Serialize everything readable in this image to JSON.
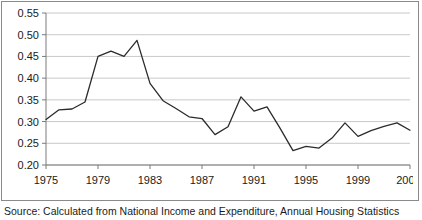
{
  "figure": {
    "caption": "Source: Calculated from National Income and Expenditure, Annual Housing Statistics",
    "border_color": "#8a8a8a",
    "background": "#ffffff"
  },
  "chart_data": {
    "type": "line",
    "title": "",
    "subtitle": "",
    "xlabel": "",
    "ylabel": "",
    "grid": "horizontal",
    "legend": "none",
    "line_color": "#2b2b2b",
    "gridline_color": "#c9c9c9",
    "axis_color": "#7a7a7a",
    "ylim": [
      0.2,
      0.55
    ],
    "ytick_step": 0.05,
    "ytick_labels": [
      "0.20",
      "0.25",
      "0.30",
      "0.35",
      "0.40",
      "0.45",
      "0.50",
      "0.55"
    ],
    "ytick_values": [
      0.2,
      0.25,
      0.3,
      0.35,
      0.4,
      0.45,
      0.5,
      0.55
    ],
    "xtick_labels": [
      "1975",
      "1979",
      "1983",
      "1987",
      "1991",
      "1995",
      "1999",
      "2003f"
    ],
    "xtick_values": [
      1975,
      1979,
      1983,
      1987,
      1991,
      1995,
      1999,
      2003
    ],
    "xlim": [
      1975,
      2003
    ],
    "x": [
      1975,
      1976,
      1977,
      1978,
      1979,
      1980,
      1981,
      1982,
      1983,
      1984,
      1985,
      1986,
      1987,
      1988,
      1989,
      1990,
      1991,
      1992,
      1993,
      1994,
      1995,
      1996,
      1997,
      1998,
      1999,
      2000,
      2001,
      2002,
      2003
    ],
    "categories": [
      "1975",
      "1976",
      "1977",
      "1978",
      "1979",
      "1980",
      "1981",
      "1982",
      "1983",
      "1984",
      "1985",
      "1986",
      "1987",
      "1988",
      "1989",
      "1990",
      "1991",
      "1992",
      "1993",
      "1994",
      "1995",
      "1996",
      "1997",
      "1998",
      "1999",
      "2000",
      "2001",
      "2002",
      "2003f"
    ],
    "values": [
      0.305,
      0.327,
      0.329,
      0.345,
      0.45,
      0.462,
      0.45,
      0.487,
      0.388,
      0.348,
      0.33,
      0.311,
      0.307,
      0.27,
      0.288,
      0.357,
      0.324,
      0.334,
      0.285,
      0.233,
      0.243,
      0.239,
      0.262,
      0.297,
      0.266,
      0.279,
      0.289,
      0.297,
      0.28
    ],
    "series": [
      {
        "name": "ratio",
        "values": [
          0.305,
          0.327,
          0.329,
          0.345,
          0.45,
          0.462,
          0.45,
          0.487,
          0.388,
          0.348,
          0.33,
          0.311,
          0.307,
          0.27,
          0.288,
          0.357,
          0.324,
          0.334,
          0.285,
          0.233,
          0.243,
          0.239,
          0.262,
          0.297,
          0.266,
          0.279,
          0.289,
          0.297,
          0.28
        ]
      }
    ]
  }
}
